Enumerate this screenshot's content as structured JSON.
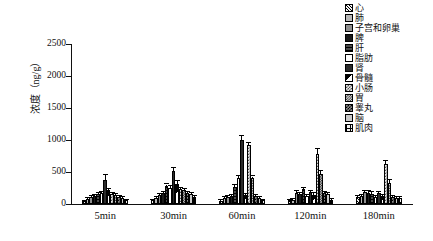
{
  "chart_data": {
    "type": "bar",
    "title": "",
    "xlabel": "",
    "ylabel": "浓度（ng/g）",
    "ylim": [
      0,
      2500
    ],
    "yticks": [
      0,
      500,
      1000,
      1500,
      2000,
      2500
    ],
    "grid": false,
    "legend_position": "top-right",
    "categories": [
      "5min",
      "30min",
      "60min",
      "120min",
      "180min"
    ],
    "series": [
      {
        "name": "心",
        "values": [
          40,
          55,
          50,
          55,
          110
        ],
        "errors": [
          10,
          12,
          12,
          10,
          15
        ]
      },
      {
        "name": "肺",
        "values": [
          85,
          95,
          90,
          70,
          130
        ],
        "errors": [
          12,
          15,
          15,
          12,
          18
        ]
      },
      {
        "name": "子宫和卵巢",
        "values": [
          110,
          140,
          110,
          175,
          180
        ],
        "errors": [
          15,
          20,
          18,
          22,
          22
        ]
      },
      {
        "name": "脾",
        "values": [
          120,
          165,
          130,
          155,
          175
        ],
        "errors": [
          15,
          20,
          18,
          20,
          22
        ]
      },
      {
        "name": "肝",
        "values": [
          150,
          275,
          270,
          230,
          160
        ],
        "errors": [
          20,
          30,
          30,
          28,
          22
        ]
      },
      {
        "name": "脂肪",
        "values": [
          165,
          250,
          400,
          120,
          115
        ],
        "errors": [
          20,
          25,
          35,
          18,
          18
        ]
      },
      {
        "name": "肾",
        "values": [
          380,
          515,
          1000,
          180,
          165
        ],
        "errors": [
          75,
          50,
          60,
          25,
          22
        ]
      },
      {
        "name": "骨髓",
        "values": [
          215,
          320,
          140,
          145,
          120
        ],
        "errors": [
          25,
          35,
          20,
          20,
          18
        ]
      },
      {
        "name": "小肠",
        "values": [
          155,
          230,
          915,
          775,
          620
        ],
        "errors": [
          20,
          25,
          35,
          90,
          55
        ]
      },
      {
        "name": "胃",
        "values": [
          140,
          215,
          400,
          470,
          335
        ],
        "errors": [
          18,
          22,
          30,
          40,
          35
        ]
      },
      {
        "name": "睾丸",
        "values": [
          110,
          175,
          125,
          165,
          110
        ],
        "errors": [
          15,
          20,
          18,
          20,
          15
        ]
      },
      {
        "name": "脑",
        "values": [
          90,
          150,
          100,
          160,
          100
        ],
        "errors": [
          12,
          18,
          15,
          18,
          15
        ]
      },
      {
        "name": "肌肉",
        "values": [
          55,
          110,
          55,
          65,
          95
        ],
        "errors": [
          10,
          15,
          10,
          12,
          14
        ]
      }
    ]
  },
  "axis": {
    "y_title": "浓度（ng/g）",
    "y_tick_labels": [
      "0",
      "500",
      "1000",
      "1500",
      "2000",
      "2500"
    ],
    "x_tick_labels": [
      "5min",
      "30min",
      "60min",
      "120min",
      "180min"
    ]
  },
  "legend": {
    "items": [
      {
        "label": "心",
        "swatch": "pattern-diag-hatch"
      },
      {
        "label": "肺",
        "swatch": "solid-light-gray"
      },
      {
        "label": "子宫和卵巢",
        "swatch": "solid-mid-gray"
      },
      {
        "label": "脾",
        "swatch": "solid-black"
      },
      {
        "label": "肝",
        "swatch": "horizontal-lines"
      },
      {
        "label": "脂肪",
        "swatch": "solid-white"
      },
      {
        "label": "肾",
        "swatch": "solid-dark"
      },
      {
        "label": "骨髓",
        "swatch": "half-diagonal"
      },
      {
        "label": "小肠",
        "swatch": "checker-coarse"
      },
      {
        "label": "胃",
        "swatch": "checker-fine"
      },
      {
        "label": "睾丸",
        "swatch": "checker-dark"
      },
      {
        "label": "脑",
        "swatch": "solid-gray"
      },
      {
        "label": "肌肉",
        "swatch": "grid-cross"
      }
    ]
  },
  "colors": {
    "axis": "#111111",
    "background": "#ffffff",
    "bar_outline": "#000000"
  }
}
